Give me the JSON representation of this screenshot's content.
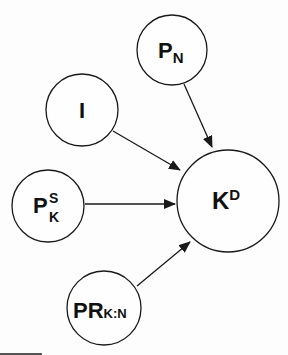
{
  "diagram": {
    "type": "directed-graph",
    "stroke_color": "#1a1a1a",
    "background": "#fdfdfd",
    "nodes": [
      {
        "id": "PN",
        "main": "P",
        "sub": "N",
        "sup": "",
        "cx": 172,
        "cy": 50,
        "r": 35
      },
      {
        "id": "I",
        "main": "I",
        "sub": "",
        "sup": "",
        "cx": 82,
        "cy": 110,
        "r": 36
      },
      {
        "id": "PSK",
        "main": "P",
        "sub": "K",
        "sup": "S",
        "cx": 48,
        "cy": 206,
        "r": 36
      },
      {
        "id": "PRKN",
        "main": "PR",
        "sub": "K:N",
        "sup": "",
        "cx": 104,
        "cy": 308,
        "r": 37
      },
      {
        "id": "KD",
        "main": "K",
        "sub": "",
        "sup": "D",
        "cx": 228,
        "cy": 201,
        "r": 51
      }
    ],
    "edges": [
      {
        "from": "PN",
        "to": "KD"
      },
      {
        "from": "I",
        "to": "KD"
      },
      {
        "from": "PSK",
        "to": "KD"
      },
      {
        "from": "PRKN",
        "to": "KD"
      }
    ]
  },
  "labels": {
    "pn": {
      "main": "P",
      "sub": "N"
    },
    "i": {
      "main": "I"
    },
    "psk": {
      "main": "P",
      "sup": "S",
      "sub": "K"
    },
    "prkn": {
      "main": "PR",
      "sub": "K:N"
    },
    "kd": {
      "main": "K",
      "sup": "D"
    }
  }
}
